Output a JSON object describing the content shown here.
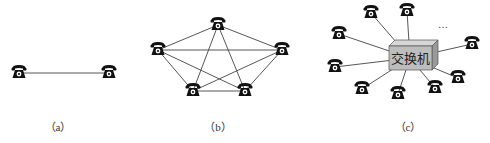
{
  "figure": {
    "panels": [
      {
        "id": "a",
        "caption": "（a）",
        "caption_x": 58,
        "topology": "point-to-point",
        "phones": [
          [
            19,
            73
          ],
          [
            109,
            73
          ]
        ],
        "links": [
          [
            0,
            1
          ]
        ]
      },
      {
        "id": "b",
        "caption": "（b）",
        "caption_x": 218,
        "topology": "full-mesh",
        "phones": [
          [
            218,
            25
          ],
          [
            158,
            50
          ],
          [
            282,
            50
          ],
          [
            193,
            91
          ],
          [
            245,
            91
          ]
        ],
        "links": [
          [
            0,
            1
          ],
          [
            0,
            2
          ],
          [
            0,
            3
          ],
          [
            0,
            4
          ],
          [
            1,
            2
          ],
          [
            1,
            3
          ],
          [
            1,
            4
          ],
          [
            2,
            3
          ],
          [
            2,
            4
          ],
          [
            3,
            4
          ]
        ]
      },
      {
        "id": "c",
        "caption": "（c）",
        "caption_x": 408,
        "topology": "star",
        "switch_label": "交换机",
        "switch_center": [
          410,
          58
        ],
        "ellipsis": "…",
        "phones": [
          [
            371,
            13
          ],
          [
            407,
            11
          ],
          [
            339,
            34
          ],
          [
            335,
            67
          ],
          [
            362,
            89
          ],
          [
            398,
            94
          ],
          [
            435,
            88
          ],
          [
            458,
            78
          ],
          [
            472,
            44
          ]
        ]
      }
    ],
    "colors": {
      "line": "#444444",
      "phone": "#111111",
      "switch_front": "#bdbdbd",
      "switch_top": "#d6d6d6",
      "switch_side": "#9a9a9a",
      "switch_text": "#222222"
    },
    "icon": "telephone-icon"
  }
}
